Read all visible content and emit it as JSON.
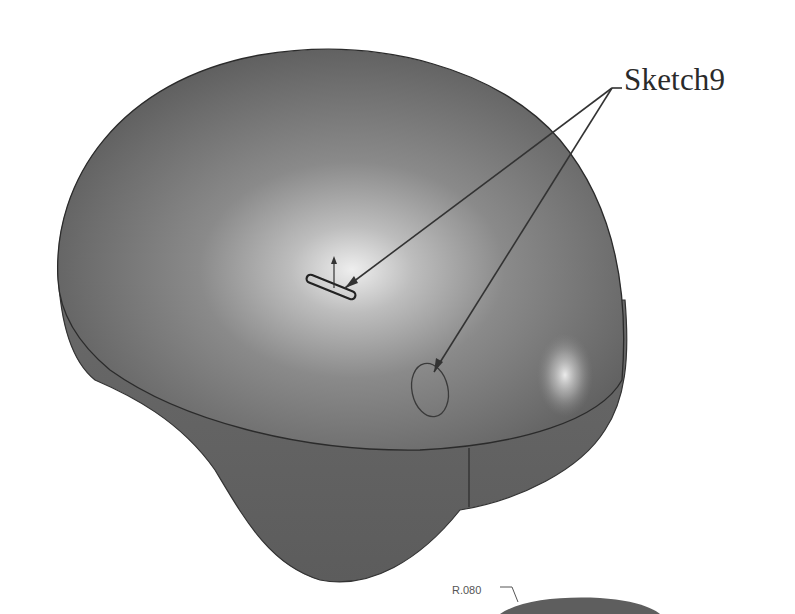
{
  "figure": {
    "callout": {
      "label": "Sketch9",
      "targets": [
        "slot-sketch-on-top",
        "ellipse-sketch-on-side"
      ]
    },
    "dimension": {
      "label": "R.080"
    },
    "colors": {
      "background": "#ffffff",
      "body_shade": "#6e6e6e",
      "body_dark": "#4a4a4a",
      "highlight": "#e8e8e8",
      "edge_line": "#2b2b2b",
      "leader_line": "#333333"
    }
  }
}
